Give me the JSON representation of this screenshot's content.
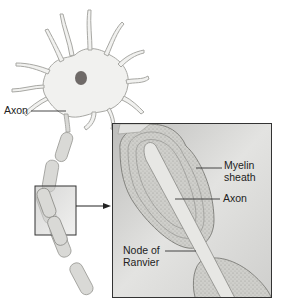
{
  "diagram": {
    "labels": {
      "axon_outer": "Axon",
      "myelin_line1": "Myelin",
      "myelin_line2": "sheath",
      "axon_inner": "Axon",
      "node_line1": "Node of",
      "node_line2": "Ranvier"
    },
    "colors": {
      "cell_fill": "#f1f1ef",
      "cell_stroke": "#a8a8a4",
      "nucleus": "#6f6a68",
      "inset_bg": "#d5d5d3",
      "inset_border": "#333333",
      "myelin": "#c9c9c5",
      "axon": "#e4e4e1",
      "leader": "#333333"
    }
  }
}
